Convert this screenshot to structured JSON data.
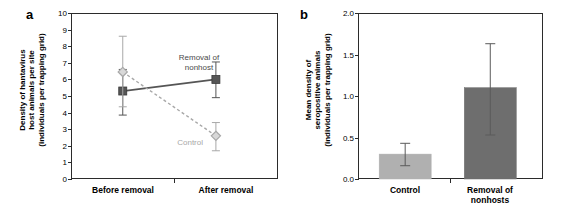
{
  "figure": {
    "panels": [
      {
        "letter": "a",
        "ytitle_lines": [
          "Density of hantavirus",
          "host animals per site",
          "(individuals per trapping grid)"
        ],
        "yticks": [
          "0",
          "1",
          "2",
          "3",
          "4",
          "5",
          "6",
          "7",
          "8",
          "9",
          "10"
        ],
        "xlabels": [
          [
            "Before removal"
          ],
          [
            "After removal"
          ]
        ],
        "annotations": {
          "removal": [
            "Removal of",
            "nonhost"
          ],
          "control": [
            "Control"
          ]
        }
      },
      {
        "letter": "b",
        "ytitle_lines": [
          "Mean density of",
          "seropositive animals",
          "(individuals per trapping grid)"
        ],
        "yticks": [
          "0.0",
          "0.5",
          "1.0",
          "1.5",
          "2.0"
        ],
        "xlabels": [
          [
            "Control"
          ],
          [
            "Removal of",
            "nonhosts"
          ]
        ]
      }
    ]
  },
  "colors": {
    "axis": "#2b2b2b",
    "removal_dark": "#555555",
    "control_light": "#a8a8a8",
    "bar_control": "#b0b0b0",
    "bar_removal": "#6e6e6e",
    "text": "#000000"
  },
  "chart_data": [
    {
      "type": "line",
      "title": "",
      "panel": "a",
      "xlabel": "",
      "ylabel": "Density of hantavirus host animals per site (individuals per trapping grid)",
      "categories": [
        "Before removal",
        "After removal"
      ],
      "ylim": [
        0,
        10
      ],
      "yticks": [
        0,
        1,
        2,
        3,
        4,
        5,
        6,
        7,
        8,
        9,
        10
      ],
      "grid": false,
      "legend_position": "inline-annotation",
      "series": [
        {
          "name": "Removal of nonhost",
          "style": "solid",
          "marker": "filled-square",
          "color": "#555555",
          "values": [
            5.3,
            6.0
          ],
          "err_low": [
            3.85,
            4.9
          ],
          "err_high": [
            6.6,
            7.05
          ]
        },
        {
          "name": "Control",
          "style": "dashed",
          "marker": "open-diamond",
          "color": "#a8a8a8",
          "values": [
            6.45,
            2.6
          ],
          "err_low": [
            4.35,
            1.7
          ],
          "err_high": [
            8.6,
            3.4
          ]
        }
      ]
    },
    {
      "type": "bar",
      "title": "",
      "panel": "b",
      "xlabel": "",
      "ylabel": "Mean density of seropositive animals (individuals per trapping grid)",
      "categories": [
        "Control",
        "Removal of nonhosts"
      ],
      "values": [
        0.3,
        1.1
      ],
      "err_low": [
        0.16,
        0.53
      ],
      "err_high": [
        0.43,
        1.63
      ],
      "ylim": [
        0.0,
        2.0
      ],
      "yticks": [
        0.0,
        0.5,
        1.0,
        1.5,
        2.0
      ],
      "grid": false,
      "bar_colors": [
        "#b0b0b0",
        "#6e6e6e"
      ]
    }
  ]
}
